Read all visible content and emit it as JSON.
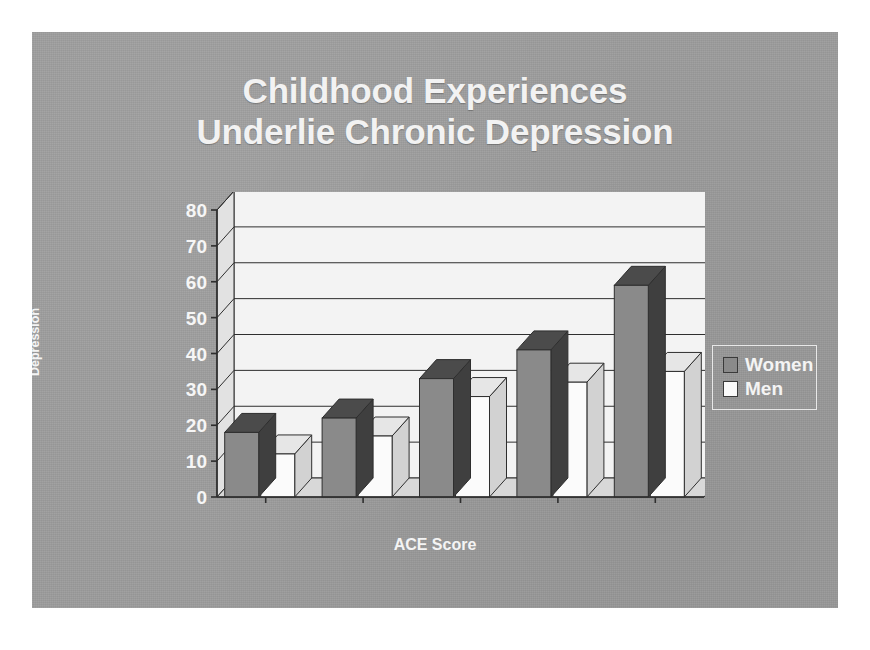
{
  "slide": {
    "background_color": "#9d9d9d",
    "page_background_color": "#ffffff"
  },
  "title": {
    "line1": "Childhood Experiences",
    "line2": "Underlie Chronic Depression",
    "color": "#f2f2f2"
  },
  "axes": {
    "y_title_line1": "% With a Lifetime History of",
    "y_title_line2": "Depression",
    "x_title": "ACE Score",
    "y_ticks": [
      "0",
      "10",
      "20",
      "30",
      "40",
      "50",
      "60",
      "70",
      "80"
    ],
    "x_categories": [
      "0",
      "1",
      "2",
      "3",
      ">=4"
    ]
  },
  "legend": {
    "position": "right",
    "items": [
      {
        "label": "Women",
        "color": "#8a8a8a"
      },
      {
        "label": "Men",
        "color": "#fbfbfb"
      }
    ]
  },
  "chart_data": {
    "type": "bar",
    "title": "Childhood Experiences Underlie Chronic Depression",
    "subtitle": "",
    "xlabel": "ACE Score",
    "ylabel": "% With a Lifetime History of Depression",
    "categories": [
      "0",
      "1",
      "2",
      "3",
      ">=4"
    ],
    "series": [
      {
        "name": "Women",
        "color": "#8a8a8a",
        "values": [
          18,
          22,
          33,
          41,
          59
        ]
      },
      {
        "name": "Men",
        "color": "#fbfbfb",
        "values": [
          12,
          17,
          28,
          32,
          35
        ]
      }
    ],
    "ylim": [
      0,
      80
    ],
    "ytick_step": 10,
    "grid": true,
    "three_d": true,
    "legend_position": "right",
    "annotations": []
  },
  "colors": {
    "women_front": "#8a8a8a",
    "women_top": "#4b4b4b",
    "women_side": "#3f3f3f",
    "men_front": "#fbfbfb",
    "men_top": "#e6e6e6",
    "men_side": "#d2d2d2",
    "wall_back": "#f3f3f3",
    "wall_left": "#e2e2e2",
    "floor": "#d8d8d8",
    "line": "#2e2e2e"
  }
}
